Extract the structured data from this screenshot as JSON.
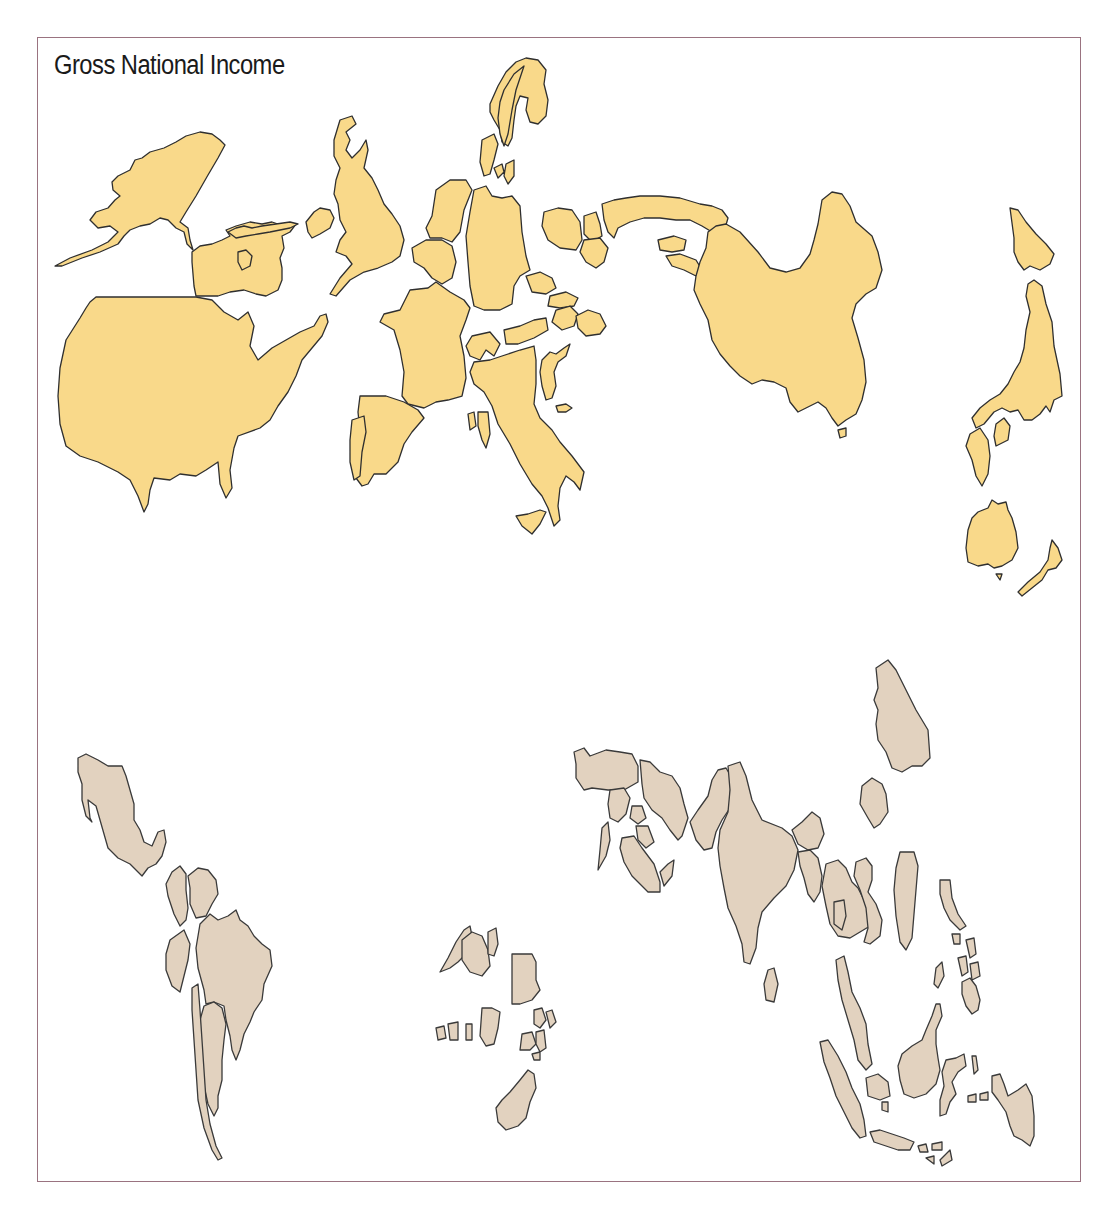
{
  "map": {
    "title": "Gross National Income",
    "type": "cartogram",
    "colors": {
      "frame_border": "#9a7380",
      "high_income_fill": "#f9d98a",
      "low_income_fill": "#e2d2bf",
      "outline": "#2f2f2f",
      "background": "#ffffff"
    },
    "groups": [
      {
        "name": "high-income-territories",
        "fill": "#f9d98a",
        "regions": [
          "Alaska",
          "Canada",
          "United States",
          "Ireland",
          "United Kingdom",
          "Norway",
          "Sweden",
          "Finland",
          "Denmark",
          "Netherlands",
          "Belgium",
          "Germany",
          "France",
          "Spain",
          "Portugal",
          "Switzerland",
          "Austria",
          "Italy",
          "Greece",
          "Poland",
          "Czechia",
          "Hungary",
          "Romania",
          "Russia",
          "Korea",
          "China",
          "Japan",
          "Australia",
          "New Zealand"
        ]
      },
      {
        "name": "low-income-territories",
        "fill": "#e2d2bf",
        "regions": [
          "Mexico",
          "Central America",
          "Colombia",
          "Venezuela",
          "Brazil",
          "Peru",
          "Chile",
          "Argentina",
          "North Africa",
          "West Africa",
          "Nigeria",
          "Egypt",
          "East Africa",
          "South Africa",
          "Turkey",
          "Iran",
          "Saudi Arabia",
          "Pakistan",
          "India",
          "Sri Lanka",
          "Bangladesh",
          "Thailand",
          "Vietnam",
          "Philippines",
          "Malaysia",
          "Indonesia",
          "Korea (South)",
          "Taiwan"
        ]
      }
    ]
  }
}
